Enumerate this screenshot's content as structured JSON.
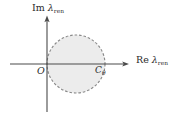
{
  "figure": {
    "kind": "complex-plane-region-diagram",
    "background_color": "#ffffff",
    "axis_color": "#4a4a4a",
    "region_fill_color": "#ececec",
    "region_border_color": "#8a8a8a",
    "region_border_style": "dashed",
    "labels": {
      "imaginary_axis": {
        "operator": "Im",
        "variable": "λ",
        "subscript": "ren",
        "full_text": "Im λ_ren"
      },
      "real_axis": {
        "operator": "Re",
        "variable": "λ",
        "subscript": "ren",
        "full_text": "Re λ_ren"
      },
      "origin": {
        "text": "O"
      },
      "contour": {
        "symbol": "C",
        "subscript": "θ",
        "full_text": "Cθ"
      }
    },
    "geometry": {
      "origin_x": 47,
      "origin_y": 64,
      "disc_center_x": 76,
      "disc_center_y": 64,
      "disc_radius": 29,
      "real_axis_start_x": 10,
      "real_axis_end_x": 128,
      "imag_axis_top_y": 17,
      "imag_axis_bottom_y": 112
    }
  }
}
